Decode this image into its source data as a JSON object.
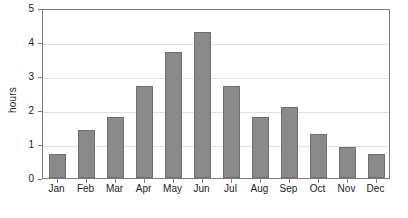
{
  "chart_data": {
    "type": "bar",
    "title": "",
    "subtitle": "",
    "xlabel": "",
    "ylabel": "hours",
    "categories": [
      "Jan",
      "Feb",
      "Mar",
      "Apr",
      "May",
      "Jun",
      "Jul",
      "Aug",
      "Sep",
      "Oct",
      "Nov",
      "Dec"
    ],
    "values": [
      0.7,
      1.4,
      1.8,
      2.7,
      3.7,
      4.3,
      2.7,
      1.8,
      2.1,
      1.3,
      0.9,
      0.7
    ],
    "ylim": [
      0,
      5
    ],
    "ytick_labels": [
      "0",
      "1",
      "2",
      "3",
      "4",
      "5"
    ],
    "ytick_values": [
      0,
      1,
      2,
      3,
      4,
      5
    ],
    "grid": true,
    "grid_axis": "y",
    "legend": false,
    "legend_position": "none",
    "annotations": [],
    "colors": {
      "bar_fill": "#8a8a8a",
      "bar_border": "#6f6f6f",
      "gridline": "#e2e2e2",
      "axis": "#7d7d7d",
      "background": "#ffffff",
      "text": "#1a1a1a"
    }
  }
}
